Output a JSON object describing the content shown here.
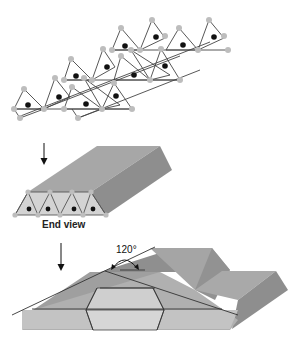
{
  "figure": {
    "panels": [
      {
        "id": "chain",
        "description": "Chain of linked silica tetrahedra (top view)"
      },
      {
        "id": "block",
        "description": "Single-chain silicate shown as a prism with end view"
      },
      {
        "id": "cleavage",
        "description": "Stacked chains with cleavage planes intersecting"
      }
    ],
    "labels": {
      "end_view": "End view",
      "angle": "120°"
    },
    "colors": {
      "oxygen": "#bdbdbd",
      "silicon": "#111111",
      "bond": "#444444",
      "prism_top": "#a9a9a9",
      "prism_side": "#8f8f8f",
      "prism_end": "#d2d2d2",
      "line": "#333333"
    },
    "arrows": [
      {
        "id": "arrow-1",
        "direction": "down"
      },
      {
        "id": "arrow-2",
        "direction": "down"
      }
    ]
  }
}
